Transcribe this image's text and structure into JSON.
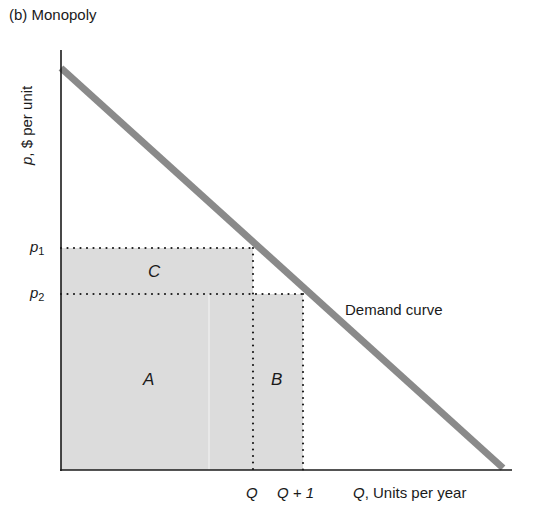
{
  "title": "(b) Monopoly",
  "axes": {
    "y_label_var": "p",
    "y_label_rest": ", $ per unit",
    "x_label_var": "Q",
    "x_label_rest": ", Units per year"
  },
  "price_labels": [
    {
      "var": "p",
      "sub": "1"
    },
    {
      "var": "p",
      "sub": "2"
    }
  ],
  "quantity_labels": [
    "Q",
    "Q + 1"
  ],
  "areas": {
    "a": "A",
    "b": "B",
    "c": "C"
  },
  "curve_label": "Demand curve",
  "colors": {
    "demand_line": "#8a8a8a",
    "shade": "#dcdcdc",
    "axis": "#1a1a1a"
  }
}
